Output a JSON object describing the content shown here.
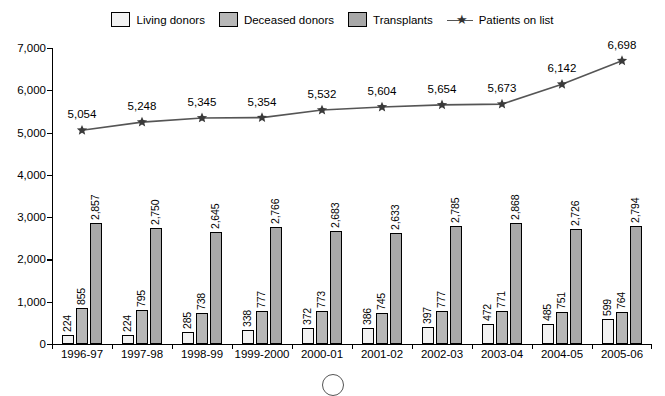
{
  "legend": {
    "items": [
      {
        "label": "Living donors",
        "type": "swatch",
        "color": "#f2f2f2",
        "icon": "legend-swatch-icon"
      },
      {
        "label": "Deceased donors",
        "type": "swatch",
        "color": "#b8b8b8",
        "icon": "legend-swatch-icon"
      },
      {
        "label": "Transplants",
        "type": "swatch",
        "color": "#a8a8a8",
        "icon": "legend-swatch-icon"
      },
      {
        "label": "Patients on list",
        "type": "line",
        "color": "#555555",
        "icon": "star-marker-icon"
      }
    ]
  },
  "chart_data": {
    "type": "bar",
    "title": "",
    "xlabel": "",
    "ylabel": "",
    "ylim": [
      0,
      7000
    ],
    "yticks": [
      "0",
      "1,000",
      "2,000",
      "3,000",
      "4,000",
      "5,000",
      "6,000",
      "7,000"
    ],
    "ytick_values": [
      0,
      1000,
      2000,
      3000,
      4000,
      5000,
      6000,
      7000
    ],
    "grid": false,
    "legend_position": "top-center",
    "categories": [
      "1996-97",
      "1997-98",
      "1998-99",
      "1999-2000",
      "2000-01",
      "2001-02",
      "2002-03",
      "2003-04",
      "2004-05",
      "2005-06"
    ],
    "series": [
      {
        "name": "Living donors",
        "type": "bar",
        "values": [
          224,
          224,
          285,
          338,
          372,
          386,
          397,
          472,
          485,
          599
        ],
        "labels": [
          "224",
          "224",
          "285",
          "338",
          "372",
          "386",
          "397",
          "472",
          "485",
          "599"
        ]
      },
      {
        "name": "Deceased donors",
        "type": "bar",
        "values": [
          855,
          795,
          738,
          777,
          773,
          745,
          777,
          771,
          751,
          764
        ],
        "labels": [
          "855",
          "795",
          "738",
          "777",
          "773",
          "745",
          "777",
          "771",
          "751",
          "764"
        ]
      },
      {
        "name": "Transplants",
        "type": "bar",
        "values": [
          2857,
          2750,
          2645,
          2766,
          2683,
          2633,
          2785,
          2868,
          2726,
          2794
        ],
        "labels": [
          "2,857",
          "2,750",
          "2,645",
          "2,766",
          "2,683",
          "2,633",
          "2,785",
          "2,868",
          "2,726",
          "2,794"
        ]
      },
      {
        "name": "Patients on list",
        "type": "line",
        "values": [
          5054,
          5248,
          5345,
          5354,
          5532,
          5604,
          5654,
          5673,
          6142,
          6698
        ],
        "labels": [
          "5,054",
          "5,248",
          "5,345",
          "5,354",
          "5,532",
          "5,604",
          "5,654",
          "5,673",
          "6,142",
          "6,698"
        ]
      }
    ]
  }
}
